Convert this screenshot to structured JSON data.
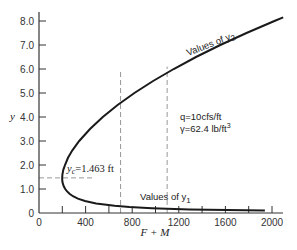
{
  "chart_data": {
    "type": "line",
    "title": "",
    "xlabel": "F + M",
    "ylabel": "y",
    "xlim": [
      0,
      2100
    ],
    "ylim": [
      0,
      8.3
    ],
    "xticks": [
      0,
      400,
      800,
      1200,
      1600,
      2000
    ],
    "xticks_minor": [
      200,
      600,
      1000,
      1400,
      1800
    ],
    "yticks": [
      0,
      1.0,
      2.0,
      3.0,
      4.0,
      5.0,
      6.0,
      7.0,
      8.0
    ],
    "ytick_labels": [
      "0",
      "1.0",
      "2.0",
      "3.0",
      "4.0",
      "5.0",
      "6.0",
      "7.0",
      "8.0"
    ],
    "xtick_labels": [
      "0",
      "400",
      "800",
      "1200",
      "1600",
      "2000"
    ],
    "grid": false,
    "legend": null,
    "series": [
      {
        "name": "Specific force curve (F+M vs y)",
        "points_y": [
          0.1,
          0.12,
          0.15,
          0.2,
          0.25,
          0.3,
          0.4,
          0.5,
          0.6,
          0.7,
          0.8,
          0.9,
          1.0,
          1.1,
          1.2,
          1.3,
          1.4,
          1.463,
          1.6,
          1.8,
          2.0,
          2.3,
          2.6,
          3.0,
          3.5,
          4.0,
          4.5,
          5.0,
          5.5,
          6.0,
          6.5,
          7.0,
          7.5,
          8.0,
          8.15
        ],
        "points_x": [
          1939,
          1616,
          1293,
          970,
          777,
          649,
          490,
          395,
          334,
          292,
          262,
          241,
          225,
          214,
          206,
          201,
          199,
          199,
          201,
          209,
          223,
          249,
          285,
          345,
          438,
          548,
          675,
          819,
          979,
          1156,
          1348,
          1556,
          1781,
          2021,
          2096
        ]
      }
    ],
    "annotations": [
      {
        "text": "Values of y₂",
        "branch": "upper",
        "label_main": "Values of y",
        "label_sub": "2"
      },
      {
        "text": "Values of y₁",
        "branch": "lower",
        "label_main": "Values of y",
        "label_sub": "1"
      },
      {
        "text": "y_c = 1.463 ft",
        "label_var": "y",
        "label_sub": "c",
        "label_rest": "=1.463 ft",
        "y": 1.463
      },
      {
        "text": "q = 10 cfs/ft",
        "label": "q=10cfs/ft"
      },
      {
        "text": "γ = 62.4 lb/ft³",
        "label": "γ=62.4 lb/ft",
        "sup": "3"
      }
    ],
    "reference_lines": [
      {
        "type": "horizontal-dashed",
        "y": 1.463,
        "x_from": 0,
        "x_to": 470
      },
      {
        "type": "vertical-dashed",
        "x": 700,
        "y_from": 0,
        "y_to": 5.9
      },
      {
        "type": "vertical-dashed",
        "x": 1100,
        "y_from": 0,
        "y_to": 6.1
      }
    ],
    "constants": {
      "q": "10 cfs/ft",
      "gamma": "62.4 lb/ft^3",
      "yc": "1.463 ft"
    }
  },
  "colors": {
    "curve": "#1a1a1a",
    "axis": "#333333",
    "dashed": "#999999",
    "background": "#ffffff"
  }
}
